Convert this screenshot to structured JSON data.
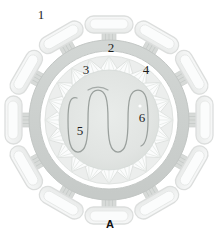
{
  "figure": {
    "panel_letter": "A",
    "background_color": "#ffffff"
  },
  "callouts": [
    {
      "id": "1",
      "label": "1",
      "refers_to": "spike-glycoprotein-peplomer",
      "x": 41,
      "y": 14
    },
    {
      "id": "2",
      "label": "2",
      "refers_to": "spike-stalk-anchor",
      "x": 111,
      "y": 47
    },
    {
      "id": "3",
      "label": "3",
      "refers_to": "lipid-envelope-membrane",
      "x": 86,
      "y": 69
    },
    {
      "id": "4",
      "label": "4",
      "refers_to": "capsid-subunit-wedge",
      "x": 146,
      "y": 69
    },
    {
      "id": "5",
      "label": "5",
      "refers_to": "matrix-nucleoplasm",
      "x": 80,
      "y": 130
    },
    {
      "id": "6",
      "label": "6",
      "refers_to": "helical-nucleocapsid-coil",
      "x": 142,
      "y": 117
    }
  ],
  "structure": {
    "center_x": 109,
    "center_y": 120,
    "spike_count": 12,
    "capsid_wedge_count": 20,
    "nucleocapsid_loop_count": 5,
    "envelope_outer_radius": 80,
    "envelope_inner_radius": 70,
    "capsid_ring_radius": 62,
    "core_radius": 52
  },
  "colors": {
    "spike_fill": "#f2f3f3",
    "spike_stroke": "#dcdedd",
    "envelope_fill": "#ccd0ce",
    "envelope_stroke": "#c2c6c4",
    "capsid_band_fill": "#e5e8e6",
    "capsid_wedge_fill": "#fbfcfc",
    "capsid_wedge_stroke": "#dfe2e0",
    "core_fill": "#e2e5e3",
    "nucleocapsid_stroke": "#9aa09d",
    "stalk_fill": "#d7dad8",
    "label_color": "#1d1d1d",
    "panel_letter_color": "#101010"
  }
}
